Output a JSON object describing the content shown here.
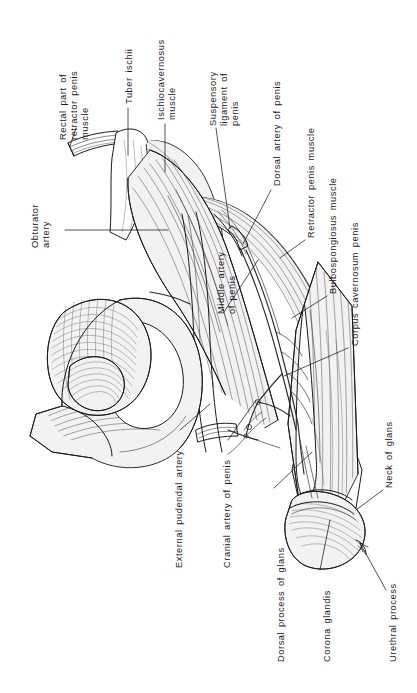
{
  "figure": {
    "kind": "anatomical-line-drawing",
    "background_color": "#ffffff",
    "ink_color": "#1a1a1a",
    "orientation_note": "All labels are rotated 90 degrees counter-clockwise (read bottom-to-top)"
  },
  "labels": [
    {
      "id": "rectal-part-of-retractor-penis-muscle",
      "text": "Rectal part of\nretractor penis\nmuscle",
      "lines": [
        "Rectal part of",
        "retractor penis",
        "muscle"
      ]
    },
    {
      "id": "tuber-ischii",
      "text": "Tuber ischii",
      "lines": [
        "Tuber ischii"
      ]
    },
    {
      "id": "ischiocavernosus-muscle",
      "text": "Ischiocavernosus\nmuscle",
      "lines": [
        "Ischiocavernosus",
        "muscle"
      ]
    },
    {
      "id": "suspensory-ligament-of-penis",
      "text": "Suspensory\nligament of\npenis",
      "lines": [
        "Suspensory",
        "ligament of",
        "penis"
      ]
    },
    {
      "id": "dorsal-artery-of-penis",
      "text": "Dorsal artery of penis",
      "lines": [
        "Dorsal artery of penis"
      ]
    },
    {
      "id": "retractor-penis-muscle",
      "text": "Retractor penis muscle",
      "lines": [
        "Retractor penis muscle"
      ]
    },
    {
      "id": "bulbospongiosus-muscle",
      "text": "Bulbospongiosus muscle",
      "lines": [
        "Bulbospongiosus muscle"
      ]
    },
    {
      "id": "corpus-cavernosum-penis",
      "text": "Corpus cavernosum penis",
      "lines": [
        "Corpus cavernosum penis"
      ]
    },
    {
      "id": "obturator-artery",
      "text": "Obturator\nartery",
      "lines": [
        "Obturator",
        "artery"
      ]
    },
    {
      "id": "middle-artery-of-penis",
      "text": "Middle artery\nof penis",
      "lines": [
        "Middle artery",
        "of penis"
      ]
    },
    {
      "id": "external-pudendal-artery",
      "text": "External pudendal artery",
      "lines": [
        "External pudendal artery"
      ]
    },
    {
      "id": "cranial-artery-of-penis",
      "text": "Cranial artery of penis",
      "lines": [
        "Cranial artery of penis"
      ]
    },
    {
      "id": "dorsal-process-of-glans",
      "text": "Dorsal process of glans",
      "lines": [
        "Dorsal process of glans"
      ]
    },
    {
      "id": "corona-glandis",
      "text": "Corona glandis",
      "lines": [
        "Corona glandis"
      ]
    },
    {
      "id": "neck-of-glans",
      "text": "Neck of glans",
      "lines": [
        "Neck of glans"
      ]
    },
    {
      "id": "urethral-process",
      "text": "Urethral process",
      "lines": [
        "Urethral process"
      ]
    }
  ]
}
